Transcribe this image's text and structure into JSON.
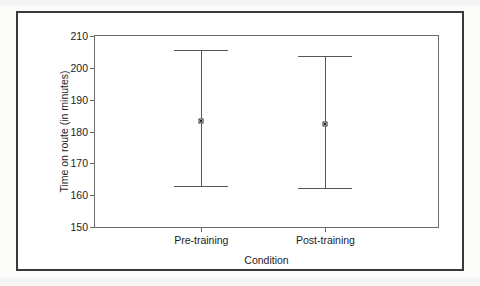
{
  "chart_data": {
    "type": "scatter",
    "title": "",
    "subtitle": "",
    "xlabel": "Condition",
    "ylabel": "Time on route (in minutes)",
    "categories": [
      "Pre-training",
      "Post-training"
    ],
    "ylim": [
      150,
      210
    ],
    "yticks": [
      150,
      160,
      170,
      180,
      190,
      200,
      210
    ],
    "ytick_labels": [
      "150",
      "160",
      "170",
      "180",
      "190",
      "200",
      "210"
    ],
    "grid": false,
    "legend": false,
    "legend_position": "none",
    "series": [
      {
        "name": "Time on route",
        "values": [
          183.4,
          182.3
        ],
        "error_upper": [
          205.6,
          203.8
        ],
        "error_lower": [
          162.8,
          162.4
        ]
      }
    ],
    "points": [
      {
        "category": "Pre-training",
        "mean": 183.4,
        "upper": 205.6,
        "lower": 162.8
      },
      {
        "category": "Post-training",
        "mean": 182.3,
        "upper": 203.8,
        "lower": 162.4
      }
    ],
    "colors": {
      "axis": "#6b6b6e",
      "errorbar": "#55555a",
      "marker": "#2a2a2d",
      "frame": "#3a3a3c",
      "background": "#ffffff",
      "text": "#1c1c1e"
    }
  },
  "axes": {
    "y_title": "Time on route (in minutes)",
    "x_title": "Condition",
    "y_tick_labels": [
      "210",
      "200",
      "190",
      "180",
      "170",
      "160",
      "150"
    ],
    "x_tick_labels": [
      "Pre-training",
      "Post-training"
    ]
  }
}
